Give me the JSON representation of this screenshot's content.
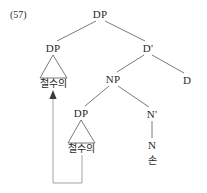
{
  "figure": {
    "example_number": "(57)",
    "background_color": "#ffffff",
    "line_color": "#6b6b6b",
    "text_color": "#2b2b2b",
    "movement_arrow_color": "#9a9a9a"
  },
  "tree": {
    "nodes": [
      {
        "id": "root_dp",
        "label": "DP",
        "x": 100,
        "y": 14,
        "kind": "phrase"
      },
      {
        "id": "spec_dp",
        "label": "DP",
        "x": 53,
        "y": 48,
        "kind": "phrase"
      },
      {
        "id": "dbar",
        "label": "D'",
        "x": 148,
        "y": 48,
        "kind": "phrase"
      },
      {
        "id": "np",
        "label": "NP",
        "x": 113,
        "y": 79,
        "kind": "phrase"
      },
      {
        "id": "d_head",
        "label": "D",
        "x": 187,
        "y": 80,
        "kind": "head"
      },
      {
        "id": "lower_dp",
        "label": "DP",
        "x": 81,
        "y": 113,
        "kind": "phrase"
      },
      {
        "id": "nbar",
        "label": "N'",
        "x": 152,
        "y": 114,
        "kind": "phrase"
      },
      {
        "id": "n_head",
        "label": "N",
        "x": 152,
        "y": 145,
        "kind": "head"
      }
    ],
    "terminals": [
      {
        "id": "spec_dp_text",
        "label": "철수의",
        "x": 53,
        "y": 84
      },
      {
        "id": "lower_dp_text",
        "label": "철수의",
        "x": 81,
        "y": 149
      },
      {
        "id": "n_head_text",
        "label": "손",
        "x": 152,
        "y": 161
      }
    ],
    "branches": [
      {
        "from": "root_dp",
        "to": "spec_dp",
        "x1": 96,
        "y1": 21,
        "x2": 57,
        "y2": 41
      },
      {
        "from": "root_dp",
        "to": "dbar",
        "x1": 105,
        "y1": 21,
        "x2": 145,
        "y2": 41
      },
      {
        "from": "dbar",
        "to": "np",
        "x1": 144,
        "y1": 55,
        "x2": 117,
        "y2": 72
      },
      {
        "from": "dbar",
        "to": "d_head",
        "x1": 152,
        "y1": 55,
        "x2": 184,
        "y2": 73
      },
      {
        "from": "np",
        "to": "lower_dp",
        "x1": 109,
        "y1": 86,
        "x2": 85,
        "y2": 106
      },
      {
        "from": "np",
        "to": "nbar",
        "x1": 118,
        "y1": 86,
        "x2": 149,
        "y2": 107
      },
      {
        "from": "nbar",
        "to": "n_head",
        "x1": 152,
        "y1": 121,
        "x2": 152,
        "y2": 138
      }
    ],
    "triangles": [
      {
        "for": "spec_dp",
        "apex_x": 53,
        "apex_y": 55,
        "left_x": 40,
        "right_x": 67,
        "base_y": 78
      },
      {
        "for": "lower_dp",
        "apex_x": 81,
        "apex_y": 120,
        "left_x": 68,
        "right_x": 95,
        "base_y": 143
      }
    ],
    "movement_arrow": {
      "description": "movement from lower DP to specifier DP",
      "start_x": 82,
      "start_y": 155,
      "bottom_y": 183,
      "end_x": 53,
      "end_y": 92,
      "arrowhead": "up"
    }
  }
}
